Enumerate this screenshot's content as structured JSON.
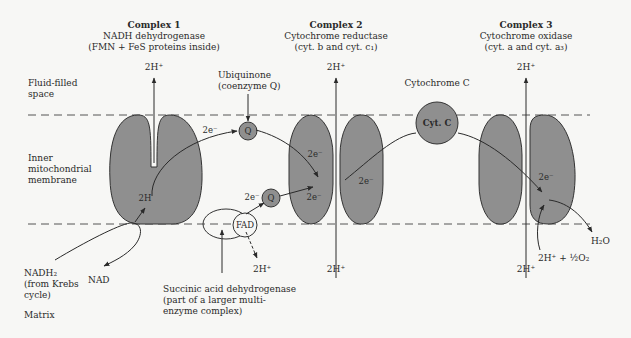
{
  "regions": {
    "fluid_space": "Fluid-filled space",
    "fluid_space_l1": "Fluid-filled",
    "fluid_space_l2": "space",
    "membrane_l1": "Inner",
    "membrane_l2": "mitochondrial",
    "membrane_l3": "membrane",
    "matrix": "Matrix"
  },
  "complexes": [
    {
      "title": "Complex 1",
      "name": "NADH dehydrogenase",
      "detail": "(FMN + FeS proteins inside)",
      "proton_out": "2H⁺"
    },
    {
      "title": "Complex 2",
      "name": "Cytochrome reductase",
      "detail": "(cyt. b and cyt. c₁)",
      "proton_out": "2H⁺",
      "proton_in": "2H⁺"
    },
    {
      "title": "Complex 3",
      "name": "Cytochrome oxidase",
      "detail": "(cyt. a and cyt. a₃)",
      "proton_out": "2H⁺",
      "proton_in": "2H⁺"
    }
  ],
  "carriers": {
    "ubiquinone_l1": "Ubiquinone",
    "ubiquinone_l2": "(coenzyme Q)",
    "q": "Q",
    "cytc_label": "Cytochrome C",
    "cytc_inner": "Cyt. C",
    "fad": "FAD"
  },
  "electrons": "2e⁻",
  "complex1_inner": "2H",
  "inputs": {
    "nadh_l1": "NADH₂",
    "nadh_l2": "(from Krebs",
    "nadh_l3": "cycle)",
    "nad": "NAD",
    "fad_proton": "2H⁺",
    "oxygen": "2H⁺ + ½O₂",
    "water": "H₂O"
  },
  "succinic": {
    "l1": "Succinic acid dehydrogenase",
    "l2": "(part of a larger multi-",
    "l3": "enzyme complex)"
  },
  "colors": {
    "protein_fill": "#8f8f8f",
    "stroke": "#333333",
    "background": "#f7f7f5"
  }
}
